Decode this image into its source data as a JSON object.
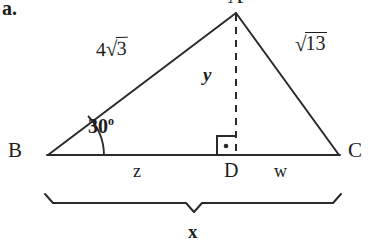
{
  "figure": {
    "item_label": "a.",
    "type": "geometry-diagram",
    "vertices": {
      "apex": "A",
      "left": "B",
      "right": "C",
      "foot": "D"
    },
    "sides": {
      "left_side": {
        "coefficient": "4",
        "radical_symbol": "√",
        "radicand": "3",
        "text": "4√3"
      },
      "right_side": {
        "coefficient": "",
        "radical_symbol": "√",
        "radicand": "13",
        "text": "√13"
      }
    },
    "angle": {
      "at_vertex": "B",
      "value": "30",
      "unit": "o",
      "text": "30º"
    },
    "altitude_label": "y",
    "base_segments": {
      "left": "z",
      "right": "w"
    },
    "base_total_label": "x",
    "right_angle_marker": "right-angle-square-with-dot",
    "colors": {
      "background": "#ffffff",
      "ink": "#1d1d1d",
      "stroke": "#2a2a2a"
    }
  }
}
